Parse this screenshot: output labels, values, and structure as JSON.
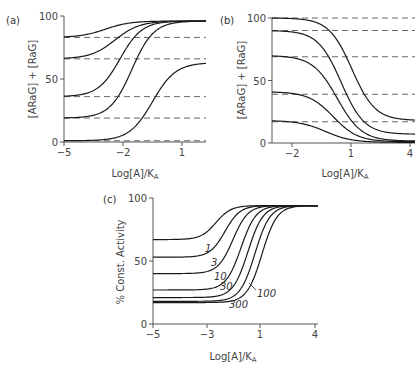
{
  "chart_data": [
    {
      "panel": "(a)",
      "type": "line",
      "ylabel": "[ARaG] + [RaG]",
      "xlabel": "Log[A]/K_A",
      "xlabel_main": "Log[A]/K",
      "xlabel_sub": "A",
      "xticks": [
        -5,
        -2,
        1
      ],
      "xtick_labels": [
        "−5",
        "−2",
        "1"
      ],
      "yticks": [
        0,
        50,
        100
      ],
      "ytick_labels": [
        "0",
        "50",
        "100"
      ],
      "xlim": [
        -5,
        2.2
      ],
      "ylim": [
        0,
        100
      ],
      "grid": false,
      "dashed_baselines": [
        83,
        66,
        36,
        19,
        1
      ],
      "series": [
        {
          "name": "curve1",
          "start": 83,
          "end": 96,
          "midpoint": -2.9,
          "slope": 1.6
        },
        {
          "name": "curve2",
          "start": 66,
          "end": 96,
          "midpoint": -2.4,
          "slope": 1.6
        },
        {
          "name": "curve3",
          "start": 36,
          "end": 96,
          "midpoint": -2.15,
          "slope": 1.8
        },
        {
          "name": "curve4",
          "start": 19,
          "end": 96,
          "midpoint": -1.55,
          "slope": 1.8
        },
        {
          "name": "curve5",
          "start": 1,
          "end": 63,
          "midpoint": -0.5,
          "slope": 1.7
        }
      ]
    },
    {
      "panel": "(b)",
      "type": "line",
      "ylabel": "[ARaG] + [RaG]",
      "xlabel": "Log[A]/K_A",
      "xlabel_main": "Log[A]/K",
      "xlabel_sub": "A",
      "xticks": [
        -2,
        1,
        4
      ],
      "xtick_labels": [
        "−2",
        "1",
        "4"
      ],
      "yticks": [
        0,
        50,
        100
      ],
      "ytick_labels": [
        "0",
        "50",
        "100"
      ],
      "xlim": [
        -3,
        4
      ],
      "ylim": [
        0,
        100
      ],
      "grid": false,
      "dashed_baselines": [
        100,
        90,
        69,
        39,
        17
      ],
      "series": [
        {
          "name": "curve1",
          "start": 100,
          "end": 18,
          "midpoint": 1.05,
          "slope": 1.7
        },
        {
          "name": "curve2",
          "start": 90,
          "end": 7,
          "midpoint": 0.5,
          "slope": 1.7
        },
        {
          "name": "curve3",
          "start": 70,
          "end": 1.5,
          "midpoint": 0.3,
          "slope": 1.6
        },
        {
          "name": "curve4",
          "start": 41,
          "end": 1,
          "midpoint": 0.1,
          "slope": 1.6
        },
        {
          "name": "curve5",
          "start": 18,
          "end": 0.5,
          "midpoint": -0.3,
          "slope": 1.5
        }
      ]
    },
    {
      "panel": "(c)",
      "type": "line",
      "ylabel": "% Const. Activity",
      "xlabel": "Log[A]/K_A",
      "xlabel_main": "Log[A]/K",
      "xlabel_sub": "A",
      "xticks": [
        -5,
        -3,
        1,
        4
      ],
      "xtick_labels": [
        "−5",
        "−3",
        "1",
        "4"
      ],
      "xtick_px": [
        153,
        207,
        260,
        315
      ],
      "yticks": [
        0,
        50,
        100
      ],
      "ytick_labels": [
        "0",
        "50",
        "100"
      ],
      "ylim": [
        0,
        100
      ],
      "grid": false,
      "series": [
        {
          "name": "0",
          "label": "",
          "start": 67,
          "end": 94,
          "mid_px": 216
        },
        {
          "name": "1",
          "label": "1",
          "start": 53,
          "end": 94,
          "mid_px": 225
        },
        {
          "name": "3",
          "label": "3",
          "start": 40,
          "end": 94,
          "mid_px": 233
        },
        {
          "name": "10",
          "label": "10",
          "start": 27,
          "end": 94,
          "mid_px": 241
        },
        {
          "name": "30",
          "label": "30",
          "start": 21,
          "end": 94,
          "mid_px": 248
        },
        {
          "name": "100",
          "label": "100",
          "start": 18,
          "end": 94,
          "mid_px": 255
        },
        {
          "name": "300",
          "label": "300",
          "start": 17,
          "end": 94,
          "mid_px": 262
        }
      ],
      "curve_labels": [
        {
          "text": "1",
          "x": 205,
          "y": 252
        },
        {
          "text": "3",
          "x": 211,
          "y": 266
        },
        {
          "text": "10",
          "x": 214,
          "y": 280
        },
        {
          "text": "30",
          "x": 220,
          "y": 290
        },
        {
          "text": "100",
          "x": 257,
          "y": 297
        },
        {
          "text": "300",
          "x": 229,
          "y": 308
        }
      ]
    }
  ]
}
